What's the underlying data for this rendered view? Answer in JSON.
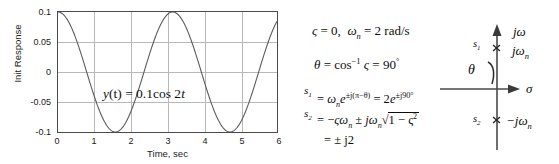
{
  "chart_data": {
    "type": "line",
    "title": "",
    "xlabel": "Time, sec",
    "ylabel": "Init Response",
    "xlim": [
      0,
      6
    ],
    "ylim": [
      -0.1,
      0.1
    ],
    "grid": true,
    "legend": "none",
    "xticks": [
      "0",
      "1",
      "2",
      "3",
      "4",
      "5",
      "6"
    ],
    "yticks": [
      "0.1",
      "0.05",
      "0",
      "-0.05",
      "-0.1"
    ],
    "annotation": "y(t) = 0.1 cos 2t",
    "series": [
      {
        "name": "y(t) = 0.1cos2t",
        "formula": "y(t) = 0.1*cos(2t)",
        "amplitude": 0.1,
        "omega": 2,
        "x": [
          0,
          0.25,
          0.5,
          0.75,
          1.0,
          1.25,
          1.5,
          1.5708,
          1.75,
          2.0,
          2.25,
          2.5,
          2.75,
          3.0,
          3.1416,
          3.25,
          3.5,
          3.75,
          4.0,
          4.25,
          4.5,
          4.7124,
          4.75,
          5.0,
          5.25,
          5.5,
          5.75,
          6.0
        ],
        "values": [
          0.1,
          0.0878,
          0.054,
          0.0071,
          -0.0416,
          -0.0801,
          -0.0998,
          -0.1,
          -0.0982,
          -0.0654,
          -0.0221,
          0.0284,
          0.0701,
          0.096,
          0.1,
          0.0992,
          0.0754,
          0.0348,
          -0.0146,
          -0.0612,
          -0.0911,
          -0.1,
          -0.0997,
          -0.0839,
          -0.0483,
          -0.0012,
          0.0458,
          0.0822
        ]
      }
    ]
  },
  "chart_annotation": {
    "prefix": "y",
    "arg": "(t)",
    "equals": " = 0.1",
    "func": "cos 2",
    "var": "t"
  },
  "equations": {
    "line1": {
      "zeta": "ς",
      "eq1": " = 0,",
      "omega": "ω",
      "sub_n": "n",
      "eq2": " = 2 rad/s"
    },
    "line2": {
      "theta": "θ",
      "equals": " = cos",
      "exp": "−1",
      "zeta": " ς",
      "result": " = 90",
      "degree": "°"
    },
    "line3": {
      "lhs": "s",
      "lhs_sub": "1",
      "rhs_pre": " = ",
      "omega": "ω",
      "omega_sub": "n",
      "e": "e",
      "exp": "±j(π−θ)",
      "mid": " = 2",
      "e2": "e",
      "exp2": "±j90°"
    },
    "line4": {
      "lhs": "s",
      "lhs_sub": "2",
      "rhs_pre": " = −",
      "zeta": "ς",
      "omega": "ω",
      "omega_sub": "n",
      "pm": " ± ",
      "j": "j",
      "omega2": "ω",
      "omega2_sub": "n",
      "radical": "√",
      "radicand": "1 − ς",
      "radicand_sup": "2"
    },
    "line5": {
      "text": "= ± j2"
    }
  },
  "splane": {
    "axis_imag_label": "jω",
    "axis_real_label": "σ",
    "pole1_label": "s",
    "pole1_sub": "1",
    "pole1_value": "jω",
    "pole1_value_sub": "n",
    "pole2_label": "s",
    "pole2_sub": "2",
    "pole2_value": "−jω",
    "pole2_value_sub": "n",
    "theta_label": "θ",
    "pole_marker": "×"
  },
  "colors": {
    "curve": "#5a5a5a",
    "grid": "#b8b8b8",
    "frame": "#4a4a4a",
    "text": "#0d0d0d"
  }
}
